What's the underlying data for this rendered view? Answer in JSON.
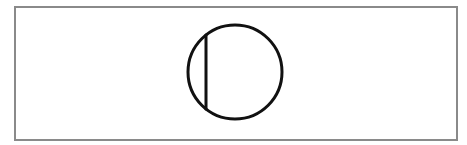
{
  "diagram": {
    "frame": {
      "border_color": "#8a8a8a"
    },
    "symbol": {
      "name": "circle-with-vertical-chord",
      "circle": {
        "cx": 235,
        "cy": 72,
        "r": 47
      },
      "chord": {
        "x1": 206,
        "y1": 35,
        "x2": 206,
        "y2": 109
      },
      "stroke_color": "#111111",
      "stroke_width": 3
    }
  }
}
